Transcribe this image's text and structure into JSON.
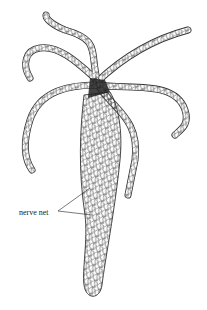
{
  "figure": {
    "labels": [
      {
        "text": "nerve net",
        "points_to": "body column net"
      }
    ],
    "colors": {
      "ink": "#222222",
      "background": "#ffffff"
    }
  }
}
